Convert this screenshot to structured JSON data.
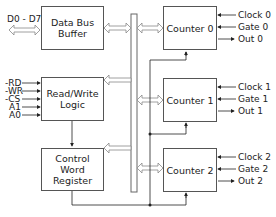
{
  "blocks": {
    "data_bus_buffer": "Data Bus\nBuffer",
    "read_write_logic": "Read/Write\nLogic",
    "control_word_register": "Control Word\nRegister",
    "counter0": "Counter 0",
    "counter1": "Counter 1",
    "counter2": "Counter 2"
  },
  "inputs": {
    "data_bus": "D0 - D7",
    "rd": "-RD",
    "wr": "-WR",
    "cs": "-CS",
    "a1": "A1",
    "a0": "A0"
  },
  "counter_signals": [
    {
      "clock": "Clock 0",
      "gate": "Gate 0",
      "out": "Out 0"
    },
    {
      "clock": "Clock 1",
      "gate": "Gate 1",
      "out": "Out 1"
    },
    {
      "clock": "Clock 2",
      "gate": "Gate 2",
      "out": "Out 2"
    }
  ]
}
